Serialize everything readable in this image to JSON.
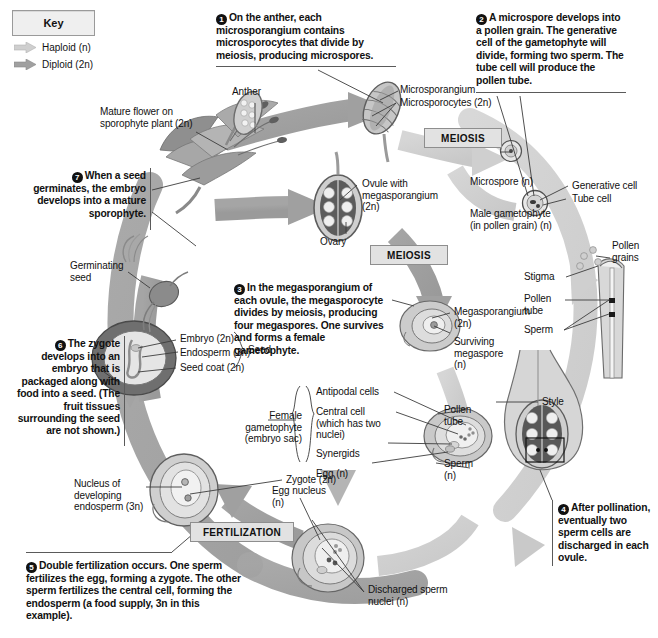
{
  "diagram": {
    "key": {
      "title": "Key",
      "items": [
        {
          "label": "Haploid (n)",
          "color": "#c9c9c9"
        },
        {
          "label": "Diploid (2n)",
          "color": "#9b9b9b"
        }
      ]
    },
    "process_boxes": [
      {
        "id": "meiosis-1",
        "label": "MEIOSIS"
      },
      {
        "id": "meiosis-2",
        "label": "MEIOSIS"
      },
      {
        "id": "fertilization",
        "label": "FERTILIZATION"
      }
    ],
    "steps": [
      {
        "num": "1",
        "text": "On the anther, each microsporangium contains microsporocytes that divide by meiosis, producing microspores."
      },
      {
        "num": "2",
        "text": "A microspore develops into a pollen grain. The generative cell of the gametophyte will divide, forming two sperm. The tube cell will produce the pollen tube."
      },
      {
        "num": "3",
        "text": "In the megasporangium of each ovule, the megasporocyte divides by meiosis, producing four megaspores. One survives and forms a female gametophyte."
      },
      {
        "num": "4",
        "text": "After pollination, eventually two sperm cells are discharged in each ovule."
      },
      {
        "num": "5",
        "text": "Double fertilization occurs. One sperm fertilizes the egg, forming a zygote. The other sperm fertilizes the central cell, forming the endosperm (a food supply, 3n in this example)."
      },
      {
        "num": "6",
        "text": "The zygote develops into an embryo that is packaged along with food into a seed. (The fruit tissues surrounding the seed are not shown.)"
      },
      {
        "num": "7",
        "text": "When a seed germinates, the embryo develops into a mature sporophyte."
      }
    ],
    "labels": {
      "mature_flower": "Mature flower on sporophyte plant (2n)",
      "anther": "Anther",
      "microsporangium": "Microsporangium",
      "microsporocytes": "Microsporocytes (2n)",
      "microspore": "Microspore (n)",
      "male_gametophyte": "Male gametophyte (in pollen grain) (n)",
      "generative_cell": "Generative cell",
      "tube_cell": "Tube cell",
      "pollen_grains": "Pollen grains",
      "stigma": "Stigma",
      "pollen_tube_right": "Pollen tube",
      "sperm_right": "Sperm",
      "style": "Style",
      "ovule_with_megasporangium": "Ovule with megasporangium (2n)",
      "ovary": "Ovary",
      "megasporangium": "Megasporangium (2n)",
      "surviving_megaspore": "Surviving megaspore (n)",
      "female_gametophyte": "Female gametophyte (embryo sac)",
      "antipodal_cells": "Antipodal cells",
      "central_cell": "Central cell (which has two nuclei)",
      "synergids": "Synergids",
      "egg": "Egg (n)",
      "pollen_tube_mid": "Pollen tube",
      "sperm_mid": "Sperm (n)",
      "egg_nucleus": "Egg nucleus (n)",
      "discharged_sperm_nuclei": "Discharged sperm nuclei (n)",
      "zygote": "Zygote (2n)",
      "nucleus_developing_endosperm": "Nucleus of developing endosperm (3n)",
      "embryo": "Embryo (2n)",
      "endosperm": "Endosperm (3n)",
      "seed_coat": "Seed coat (2n)",
      "seed": "Seed",
      "germinating_seed": "Germinating seed"
    },
    "colors": {
      "haploid_arrow": "#cccccc",
      "diploid_arrow": "#9e9e9e",
      "box_fill": "#e2e2e2",
      "box_border": "#8e8e8e",
      "leader": "#3c3c3c",
      "text": "#111111"
    }
  }
}
